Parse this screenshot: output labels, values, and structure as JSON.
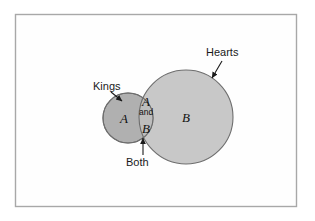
{
  "figure": {
    "type": "venn-diagram",
    "frame": {
      "x": 15,
      "y": 14,
      "width": 282,
      "height": 193,
      "border_color": "#a8a8a8",
      "background_color": "#fefefe"
    },
    "sets": [
      {
        "id": "A",
        "symbol": "A",
        "callout_label": "Kings",
        "cx": 128,
        "cy": 118,
        "r": 25,
        "fill": "#b0b0b0",
        "stroke": "#6e6e6e"
      },
      {
        "id": "B",
        "symbol": "B",
        "callout_label": "Hearts",
        "cx": 186,
        "cy": 117,
        "r": 47,
        "fill": "#c8c8c8",
        "stroke": "#6e6e6e"
      }
    ],
    "intersection": {
      "callout_label": "Both",
      "line1": "A",
      "line2": "and",
      "line3": "B",
      "fill": "#bdbdbd",
      "stroke": "#6e6e6e"
    },
    "arrows": [
      {
        "name": "kings-arrow",
        "label": "Kings",
        "x1": 111,
        "y1": 92,
        "x2": 122,
        "y2": 101
      },
      {
        "name": "hearts-arrow",
        "label": "Hearts",
        "x1": 222,
        "y1": 61,
        "x2": 212,
        "y2": 78
      },
      {
        "name": "both-arrow",
        "label": "Both",
        "x1": 143,
        "y1": 155,
        "x2": 143,
        "y2": 138
      }
    ],
    "arrow_color": "#1a1a1a"
  }
}
